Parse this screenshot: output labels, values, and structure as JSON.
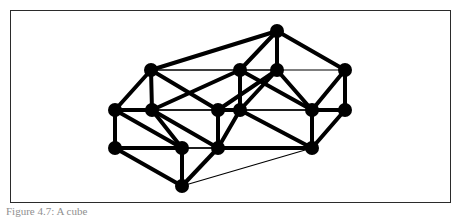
{
  "figure": {
    "caption": "Figure 4.7: A cube",
    "frame": {
      "x": 10,
      "y": 10,
      "width": 441,
      "height": 193,
      "border_color": "#2b2b2b",
      "background": "#ffffff"
    },
    "style": {
      "node_color": "#000000",
      "node_radius": 7,
      "thick_edge_color": "#000000",
      "thick_edge_width": 4,
      "thin_edge_color": "#000000",
      "thin_edge_width": 1.2
    }
  },
  "chart_data": {
    "type": "diagram",
    "title": "",
    "nodes": [
      {
        "id": "n0",
        "label": "",
        "x": 277,
        "y": 31,
        "layer": "front",
        "role": "top-apex"
      },
      {
        "id": "n1",
        "label": "",
        "x": 151,
        "y": 70,
        "layer": "front",
        "role": "upper-left"
      },
      {
        "id": "n2",
        "label": "",
        "x": 240,
        "y": 70,
        "layer": "front",
        "role": "upper-mid-left"
      },
      {
        "id": "n3",
        "label": "",
        "x": 277,
        "y": 70,
        "layer": "front",
        "role": "upper-mid-right"
      },
      {
        "id": "n4",
        "label": "",
        "x": 345,
        "y": 70,
        "layer": "front",
        "role": "upper-right"
      },
      {
        "id": "n5",
        "label": "",
        "x": 115,
        "y": 110,
        "layer": "front",
        "role": "mid-left"
      },
      {
        "id": "n6",
        "label": "",
        "x": 152,
        "y": 110,
        "layer": "front",
        "role": "mid-left-inner"
      },
      {
        "id": "n7",
        "label": "",
        "x": 218,
        "y": 110,
        "layer": "front",
        "role": "mid-center-left"
      },
      {
        "id": "n8",
        "label": "",
        "x": 240,
        "y": 110,
        "layer": "front",
        "role": "mid-center-right"
      },
      {
        "id": "n9",
        "label": "",
        "x": 312,
        "y": 110,
        "layer": "front",
        "role": "mid-right-inner"
      },
      {
        "id": "n10",
        "label": "",
        "x": 345,
        "y": 110,
        "layer": "front",
        "role": "mid-right"
      },
      {
        "id": "n11",
        "label": "",
        "x": 115,
        "y": 148,
        "layer": "front",
        "role": "lower-left"
      },
      {
        "id": "n12",
        "label": "",
        "x": 182,
        "y": 148,
        "layer": "front",
        "role": "lower-left-inner"
      },
      {
        "id": "n13",
        "label": "",
        "x": 218,
        "y": 148,
        "layer": "front",
        "role": "lower-center"
      },
      {
        "id": "n14",
        "label": "",
        "x": 312,
        "y": 148,
        "layer": "front",
        "role": "lower-right"
      },
      {
        "id": "n15",
        "label": "",
        "x": 182,
        "y": 186,
        "layer": "front",
        "role": "bottom-apex"
      }
    ],
    "thick_edges": [
      [
        "n0",
        "n1"
      ],
      [
        "n0",
        "n3"
      ],
      [
        "n0",
        "n4"
      ],
      [
        "n0",
        "n2"
      ],
      [
        "n1",
        "n5"
      ],
      [
        "n1",
        "n6"
      ],
      [
        "n1",
        "n7"
      ],
      [
        "n2",
        "n6"
      ],
      [
        "n2",
        "n8"
      ],
      [
        "n2",
        "n9"
      ],
      [
        "n3",
        "n8"
      ],
      [
        "n3",
        "n9"
      ],
      [
        "n3",
        "n7"
      ],
      [
        "n4",
        "n9"
      ],
      [
        "n4",
        "n10"
      ],
      [
        "n5",
        "n6"
      ],
      [
        "n5",
        "n11"
      ],
      [
        "n5",
        "n12"
      ],
      [
        "n6",
        "n12"
      ],
      [
        "n6",
        "n13"
      ],
      [
        "n7",
        "n13"
      ],
      [
        "n7",
        "n8"
      ],
      [
        "n8",
        "n13"
      ],
      [
        "n8",
        "n14"
      ],
      [
        "n9",
        "n10"
      ],
      [
        "n9",
        "n14"
      ],
      [
        "n10",
        "n14"
      ],
      [
        "n11",
        "n12"
      ],
      [
        "n11",
        "n15"
      ],
      [
        "n12",
        "n15"
      ],
      [
        "n13",
        "n15"
      ],
      [
        "n13",
        "n14"
      ]
    ],
    "thin_edges": [
      [
        "n1",
        "n4"
      ],
      [
        "n5",
        "n10"
      ],
      [
        "n11",
        "n14"
      ],
      [
        "n1",
        "n3"
      ],
      [
        "n5",
        "n9"
      ],
      [
        "n11",
        "n13"
      ],
      [
        "n6",
        "n8"
      ],
      [
        "n12",
        "n13"
      ],
      [
        "n7",
        "n9"
      ],
      [
        "n15",
        "n14"
      ],
      [
        "n15",
        "n13"
      ]
    ],
    "node_count": 16,
    "xlabel": "",
    "ylabel": "",
    "legend": []
  }
}
